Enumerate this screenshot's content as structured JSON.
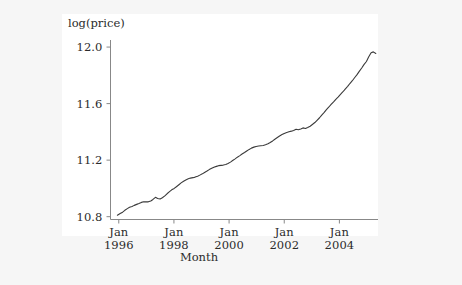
{
  "chart_data": {
    "type": "line",
    "title": "",
    "xlabel": "Month",
    "ylabel": "log(price)",
    "ylim": [
      10.78,
      12.05
    ],
    "xlim": [
      1995.7,
      2005.4
    ],
    "grid": false,
    "legend": "none",
    "y_ticks": [
      "10.8",
      "11.2",
      "11.6",
      "12.0"
    ],
    "y_tick_values": [
      10.8,
      11.2,
      11.6,
      12.0
    ],
    "x_ticks": [
      {
        "month": "Jan",
        "year": "1996"
      },
      {
        "month": "Jan",
        "year": "1998"
      },
      {
        "month": "Jan",
        "year": "2000"
      },
      {
        "month": "Jan",
        "year": "2002"
      },
      {
        "month": "Jan",
        "year": "2004"
      }
    ],
    "x_tick_values": [
      1996.0,
      1998.0,
      2000.0,
      2002.0,
      2004.0
    ],
    "line_color": "#3a3a3a",
    "panel_color": "#ffffff",
    "background_color": "#f6f6f6",
    "series": [
      {
        "name": "log(price)",
        "x": [
          1995.95,
          1996.05,
          1996.14,
          1996.22,
          1996.31,
          1996.39,
          1996.48,
          1996.56,
          1996.65,
          1996.73,
          1996.82,
          1996.9,
          1996.99,
          1997.07,
          1997.16,
          1997.24,
          1997.33,
          1997.41,
          1997.5,
          1997.58,
          1997.67,
          1997.75,
          1997.84,
          1997.92,
          1998.01,
          1998.09,
          1998.18,
          1998.26,
          1998.35,
          1998.43,
          1998.52,
          1998.6,
          1998.69,
          1998.77,
          1998.86,
          1998.94,
          1999.03,
          1999.11,
          1999.2,
          1999.28,
          1999.37,
          1999.45,
          1999.54,
          1999.62,
          1999.71,
          1999.79,
          1999.88,
          1999.96,
          2000.05,
          2000.13,
          2000.22,
          2000.3,
          2000.39,
          2000.47,
          2000.56,
          2000.64,
          2000.73,
          2000.81,
          2000.9,
          2000.98,
          2001.07,
          2001.15,
          2001.24,
          2001.32,
          2001.41,
          2001.49,
          2001.58,
          2001.66,
          2001.75,
          2001.83,
          2001.92,
          2002.0,
          2002.09,
          2002.17,
          2002.26,
          2002.34,
          2002.43,
          2002.51,
          2002.6,
          2002.68,
          2002.77,
          2002.85,
          2002.94,
          2003.02,
          2003.11,
          2003.19,
          2003.28,
          2003.36,
          2003.45,
          2003.53,
          2003.62,
          2003.7,
          2003.79,
          2003.87,
          2003.96,
          2004.04,
          2004.13,
          2004.21,
          2004.3,
          2004.38,
          2004.47,
          2004.55,
          2004.64,
          2004.72,
          2004.81,
          2004.89,
          2004.98,
          2005.06,
          2005.15,
          2005.23,
          2005.32
        ],
        "y": [
          10.81,
          10.822,
          10.832,
          10.845,
          10.857,
          10.866,
          10.872,
          10.88,
          10.887,
          10.893,
          10.901,
          10.905,
          10.906,
          10.905,
          10.911,
          10.922,
          10.937,
          10.929,
          10.925,
          10.934,
          10.947,
          10.962,
          10.977,
          10.99,
          11.0,
          11.012,
          11.026,
          11.039,
          11.051,
          11.06,
          11.068,
          11.073,
          11.076,
          11.08,
          11.086,
          11.094,
          11.103,
          11.113,
          11.123,
          11.133,
          11.142,
          11.15,
          11.156,
          11.161,
          11.163,
          11.165,
          11.169,
          11.176,
          11.186,
          11.197,
          11.209,
          11.221,
          11.232,
          11.243,
          11.254,
          11.265,
          11.276,
          11.285,
          11.292,
          11.297,
          11.3,
          11.302,
          11.304,
          11.309,
          11.316,
          11.325,
          11.336,
          11.348,
          11.36,
          11.371,
          11.381,
          11.389,
          11.396,
          11.401,
          11.405,
          11.41,
          11.418,
          11.415,
          11.421,
          11.428,
          11.424,
          11.431,
          11.44,
          11.452,
          11.466,
          11.482,
          11.5,
          11.519,
          11.538,
          11.557,
          11.576,
          11.594,
          11.612,
          11.63,
          11.648,
          11.666,
          11.684,
          11.703,
          11.722,
          11.742,
          11.762,
          11.783,
          11.805,
          11.828,
          11.852,
          11.876,
          11.898,
          11.93,
          11.96,
          11.966,
          11.955
        ]
      }
    ]
  }
}
